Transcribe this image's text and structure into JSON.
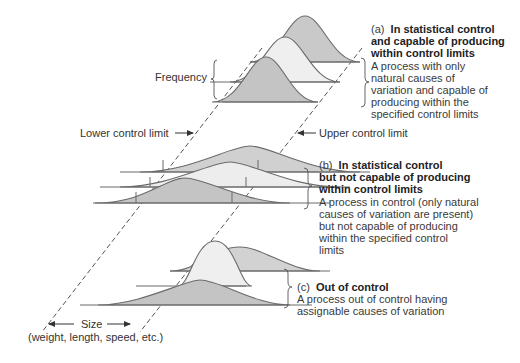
{
  "figure": {
    "labels": {
      "frequency": "Frequency",
      "lower_control_limit": "Lower control limit",
      "upper_control_limit": "Upper control limit",
      "size": "Size",
      "size_examples": "(weight, length, speed, etc.)"
    },
    "panels": [
      {
        "tag": "(a)",
        "title_lines": [
          "In statistical control",
          "and capable of producing",
          "within control limits"
        ],
        "body_lines": [
          "A process with only",
          "natural causes of",
          "variation and capable of",
          "producing within the",
          "specified control limits"
        ]
      },
      {
        "tag": "(b)",
        "title_lines": [
          "In statistical control",
          "but not capable of producing",
          "within control limits"
        ],
        "body_lines": [
          "A process in control (only natural",
          "causes of variation are present)",
          "but not capable of producing",
          "within the specified control",
          "limits"
        ]
      },
      {
        "tag": "(c)",
        "title_lines": [
          "Out of control"
        ],
        "body_lines": [
          "A process out of control having",
          "assignable causes of variation"
        ]
      }
    ],
    "colors": {
      "curve_stroke": "#6b6b6b",
      "fill_dark": "#c4c4c4",
      "fill_light": "#ececec",
      "fill_mid": "#d6d6d6",
      "dashed_line": "#555555",
      "text": "#333333"
    }
  }
}
